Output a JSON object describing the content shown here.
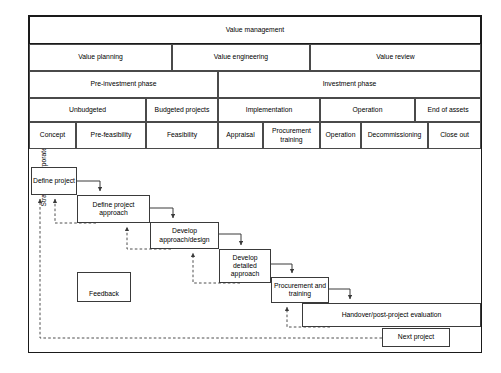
{
  "figure": {
    "side_label": "Strategy: Corporate, business and project"
  },
  "table": {
    "rows": [
      {
        "name": "value-management-row",
        "cells": [
          {
            "label": "Value management",
            "x": 0,
            "w": 452
          }
        ]
      },
      {
        "name": "value-stage-row",
        "cells": [
          {
            "label": "Value planning",
            "x": 0,
            "w": 143
          },
          {
            "label": "Value engineering",
            "x": 143,
            "w": 138
          },
          {
            "label": "Value review",
            "x": 281,
            "w": 171
          }
        ]
      },
      {
        "name": "investment-phase-row",
        "cells": [
          {
            "label": "Pre-investment phase",
            "x": 0,
            "w": 189
          },
          {
            "label": "Investment phase",
            "x": 189,
            "w": 263
          }
        ]
      },
      {
        "name": "stage-group-row",
        "cells": [
          {
            "label": "Unbudgeted",
            "x": 0,
            "w": 117
          },
          {
            "label": "Budgeted projects",
            "x": 117,
            "w": 72
          },
          {
            "label": "Implementation",
            "x": 189,
            "w": 102
          },
          {
            "label": "Operation",
            "x": 291,
            "w": 95
          },
          {
            "label": "End of assets",
            "x": 386,
            "w": 66
          }
        ]
      },
      {
        "name": "stage-detail-row",
        "cells": [
          {
            "label": "Concept",
            "x": 0,
            "w": 47
          },
          {
            "label": "Pre-feasibility",
            "x": 47,
            "w": 70
          },
          {
            "label": "Feasibility",
            "x": 117,
            "w": 72
          },
          {
            "label": "Appraisal",
            "x": 189,
            "w": 45
          },
          {
            "label": "Procurement training",
            "x": 234,
            "w": 57
          },
          {
            "label": "Operation",
            "x": 291,
            "w": 41
          },
          {
            "label": "Decommissioning",
            "x": 332,
            "w": 67
          },
          {
            "label": "Close out",
            "x": 399,
            "w": 53
          }
        ]
      }
    ]
  },
  "flow": {
    "boxes": [
      {
        "label": "Define project",
        "x": 31,
        "y": 167,
        "w": 46,
        "h": 28
      },
      {
        "label": "Define project approach",
        "x": 77,
        "y": 195,
        "w": 73,
        "h": 28
      },
      {
        "label": "Develop approach/design",
        "x": 150,
        "y": 222,
        "w": 69,
        "h": 27
      },
      {
        "label": "Develop detailed approach",
        "x": 219,
        "y": 249,
        "w": 52,
        "h": 34
      },
      {
        "label": "Procurement and training",
        "x": 271,
        "y": 277,
        "w": 58,
        "h": 26
      },
      {
        "label": "Handover/post-project evaluation",
        "x": 302,
        "y": 303,
        "w": 179,
        "h": 24
      },
      {
        "label": "Next project",
        "x": 382,
        "y": 328,
        "w": 68,
        "h": 19
      }
    ],
    "legend": {
      "label": "Feedback",
      "x": 77,
      "y": 272,
      "w": 54,
      "h": 30
    }
  }
}
